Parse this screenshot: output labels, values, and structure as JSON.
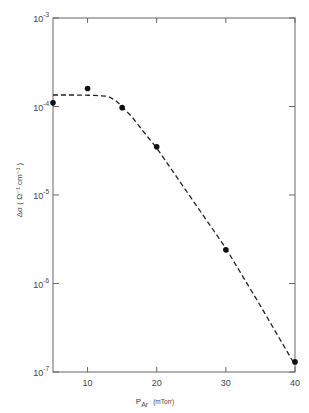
{
  "chart_data": {
    "type": "scatter",
    "title": "",
    "xlabel": "P_Ar (mTorr)",
    "xlabel_main": "P",
    "xlabel_sub": "Ar",
    "xlabel_unit": "(mTorr)",
    "ylabel": "Δσ ( Ω⁻¹ cm⁻¹ )",
    "yscale": "log",
    "xlim": [
      5,
      40
    ],
    "ylim": [
      1e-07,
      0.001
    ],
    "x_ticks": [
      10,
      20,
      30,
      40
    ],
    "x_tick_labels": [
      "10",
      "20",
      "30",
      "40"
    ],
    "y_ticks": [
      1e-07,
      1e-06,
      1e-05,
      0.0001,
      0.001
    ],
    "y_tick_labels": [
      {
        "base": "10",
        "exp": "-7"
      },
      {
        "base": "10",
        "exp": "-6"
      },
      {
        "base": "10",
        "exp": "-5"
      },
      {
        "base": "10",
        "exp": "-4"
      },
      {
        "base": "10",
        "exp": "-3"
      }
    ],
    "grid": false,
    "legend": null,
    "series": [
      {
        "name": "measured",
        "style": "points",
        "x": [
          5,
          10,
          15,
          20,
          30,
          40
        ],
        "y": [
          0.00011,
          0.00016,
          9.7e-05,
          3.5e-05,
          2.4e-06,
          1.3e-07
        ]
      },
      {
        "name": "fit",
        "style": "dashed-line",
        "x": [
          5,
          8,
          11,
          13,
          14,
          15,
          16.5,
          18,
          20,
          25,
          30,
          35,
          40
        ],
        "y": [
          0.000135,
          0.000135,
          0.000134,
          0.00013,
          0.000118,
          0.0001,
          7.5e-05,
          5.3e-05,
          3.4e-05,
          9.2e-06,
          2.5e-06,
          5.6e-07,
          1.2e-07
        ]
      }
    ]
  }
}
